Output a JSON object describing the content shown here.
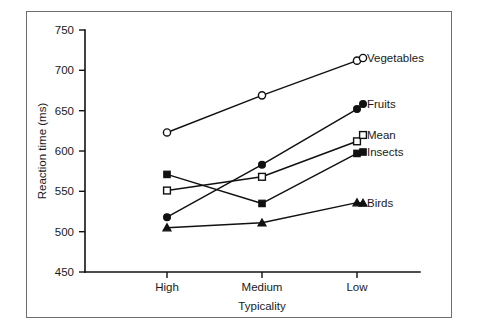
{
  "figure": {
    "frame_visible": true,
    "background_color": "#ffffff",
    "ink_color": "#111111"
  },
  "chart_data": {
    "type": "line",
    "title": "",
    "xlabel": "Typicality",
    "ylabel": "Reaction time (ms)",
    "categories": [
      "High",
      "Medium",
      "Low"
    ],
    "ylim": [
      450,
      750
    ],
    "yticks": [
      450,
      500,
      550,
      600,
      650,
      700,
      750
    ],
    "ytick_labels": [
      "450",
      "500",
      "550",
      "600",
      "650",
      "700",
      "750"
    ],
    "grid": false,
    "legend_position": "right-inline-labels",
    "series": [
      {
        "name": "Vegetables",
        "marker": "open-circle",
        "values": [
          623,
          669,
          712
        ],
        "label": "Vegetables"
      },
      {
        "name": "Fruits",
        "marker": "filled-circle",
        "values": [
          518,
          583,
          652
        ],
        "label": "Fruits"
      },
      {
        "name": "Mean",
        "marker": "open-square",
        "values": [
          551,
          568,
          612
        ],
        "label": "Mean"
      },
      {
        "name": "Insects",
        "marker": "filled-square",
        "values": [
          571,
          535,
          597
        ],
        "label": "Insects"
      },
      {
        "name": "Birds",
        "marker": "filled-triangle",
        "values": [
          505,
          511,
          536
        ],
        "label": "Birds"
      }
    ]
  },
  "labels": {
    "y_axis_title": "Reaction time (ms)",
    "x_axis_title": "Typicality",
    "x_high": "High",
    "x_medium": "Medium",
    "x_low": "Low",
    "y_750": "750",
    "y_700": "700",
    "y_650": "650",
    "y_600": "600",
    "y_550": "550",
    "y_500": "500",
    "y_450": "450",
    "legend_vegetables": "Vegetables",
    "legend_fruits": "Fruits",
    "legend_mean": "Mean",
    "legend_insects": "Insects",
    "legend_birds": "Birds"
  }
}
